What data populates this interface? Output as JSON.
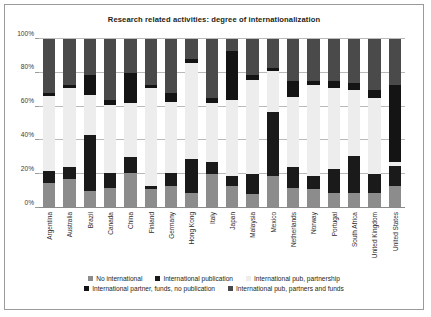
{
  "chart_data": {
    "type": "bar",
    "subtype": "stacked-percent",
    "title": "Research related activities: degree of internationalization",
    "xlabel": "",
    "ylabel": "",
    "ylim": [
      0,
      100
    ],
    "ytick_labels": [
      "0%",
      "20%",
      "40%",
      "60%",
      "80%",
      "100%"
    ],
    "ytick_values": [
      0,
      20,
      40,
      60,
      80,
      100
    ],
    "grid": true,
    "legend_position": "bottom",
    "categories": [
      "Argentina",
      "Australia",
      "Brazil",
      "Canada",
      "China",
      "Finland",
      "Germany",
      "Hong Kong",
      "Italy",
      "Japan",
      "Malaysia",
      "Mexico",
      "Netherlands",
      "Norway",
      "Portugal",
      "South Africa",
      "United Kingdom",
      "United States"
    ],
    "series": [
      {
        "name": "No international",
        "color": "#8c8c8c",
        "values": [
          15,
          17,
          10,
          12,
          21,
          11,
          13,
          9,
          20,
          13,
          8,
          19,
          12,
          11,
          9,
          9,
          9,
          13
        ]
      },
      {
        "name": "International publication",
        "color": "#1a1a1a",
        "values": [
          7,
          7,
          33,
          9,
          9,
          2,
          8,
          20,
          7,
          6,
          12,
          38,
          12,
          8,
          14,
          22,
          11,
          12
        ]
      },
      {
        "name": "International pub, partnership",
        "color": "#ededed",
        "values": [
          44,
          47,
          24,
          40,
          32,
          58,
          42,
          57,
          35,
          45,
          56,
          24,
          42,
          54,
          48,
          39,
          45,
          2
        ]
      },
      {
        "name": "International partner, funds, no publication",
        "color": "#141414",
        "values": [
          2,
          2,
          12,
          3,
          18,
          2,
          5,
          2,
          3,
          29,
          3,
          2,
          9,
          2,
          4,
          4,
          5,
          46
        ]
      },
      {
        "name": "International pub, partners and funds",
        "color": "#4a4a4a",
        "values": [
          32,
          27,
          21,
          36,
          20,
          27,
          32,
          12,
          35,
          7,
          21,
          17,
          25,
          25,
          25,
          26,
          30,
          27
        ]
      }
    ]
  },
  "legend": {
    "rows": [
      [
        {
          "label": "No international",
          "color": "#8c8c8c",
          "icon": "legend-square-icon"
        },
        {
          "label": "International publication",
          "color": "#1a1a1a",
          "icon": "legend-square-icon"
        },
        {
          "label": "International pub, partnership",
          "color": "#ededed",
          "icon": "legend-square-icon"
        }
      ],
      [
        {
          "label": "International partner, funds, no publication",
          "color": "#141414",
          "icon": "legend-square-icon"
        },
        {
          "label": "International pub, partners and funds",
          "color": "#4a4a4a",
          "icon": "legend-square-icon"
        }
      ]
    ]
  }
}
